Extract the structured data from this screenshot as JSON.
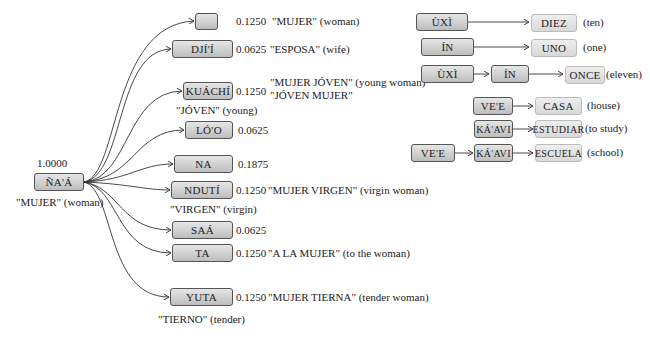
{
  "root": {
    "label": "ÑA'Á",
    "weight": "1.0000",
    "gloss": "\"MUJER\" (woman)"
  },
  "children": [
    {
      "label": "",
      "weight": "0.1250",
      "gloss": "\"MUJER\" (woman)"
    },
    {
      "label": "DJÍ'Í",
      "weight": "0.0625",
      "gloss": "\"ESPOSA\" (wife)"
    },
    {
      "label": "KUÁCHÍ",
      "weight": "0.1250",
      "gloss": "\"MUJER JÓVEN\" (young woman)",
      "gloss2": "\"JÓVEN MUJER\"",
      "sub": "\"JÓVEN\" (young)"
    },
    {
      "label": "LÓ'O",
      "weight": "0.0625"
    },
    {
      "label": "NA",
      "weight": "0.1875"
    },
    {
      "label": "NDUTÍ",
      "weight": "0.1250",
      "gloss": "\"MUJER VIRGEN\" (virgin woman)",
      "sub": "\"VIRGEN\" (virgin)"
    },
    {
      "label": "SAÁ",
      "weight": "0.0625"
    },
    {
      "label": "TA",
      "weight": "0.1250",
      "gloss": "\"A LA MUJER\" (to the woman)"
    },
    {
      "label": "YUTA",
      "weight": "0.1250",
      "gloss": "\"MUJER TIERNA\" (tender woman)",
      "sub": "\"TIERNO\" (tender)"
    }
  ],
  "numbers": [
    {
      "parts": [
        "ÙXÌ"
      ],
      "result": "DIEZ",
      "gloss": "(ten)"
    },
    {
      "parts": [
        "ÍN"
      ],
      "result": "UNO",
      "gloss": "(one)"
    },
    {
      "parts": [
        "ÙXÌ",
        "ÍN"
      ],
      "result": "ONCE",
      "gloss": "(eleven)"
    }
  ],
  "compounds": [
    {
      "parts": [
        "VE'E"
      ],
      "result": "CASA",
      "gloss": "(house)"
    },
    {
      "parts": [
        "KÁ'AVI"
      ],
      "result": "ESTUDIAR",
      "gloss": "(to study)"
    },
    {
      "parts": [
        "VE'E",
        "KÁ'AVI"
      ],
      "result": "ESCUELA",
      "gloss": "(school)"
    }
  ]
}
